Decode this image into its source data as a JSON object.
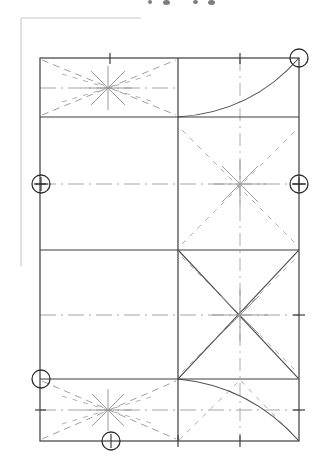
{
  "document": {
    "title": "Technical Fold Pattern Drawing",
    "type": "engineering-line-drawing",
    "canvas": {
      "width": 318,
      "height": 460
    },
    "background_color": "#ffffff",
    "line_color": "#4a4a4a",
    "dashed_color": "#8d8d8d",
    "centerline_color": "#9a9a9a",
    "frame_color": "#c9c9c9"
  },
  "frame": {
    "name": "page-border-fragment",
    "top_rule": {
      "x1": 21,
      "y1": 18,
      "x2": 141,
      "y2": 18
    },
    "left_rule": {
      "x1": 21,
      "y1": 18,
      "x2": 21,
      "y2": 266
    }
  },
  "geometry": {
    "main_rect": {
      "x": 40,
      "y": 58,
      "width": 259,
      "height": 383
    },
    "horizontal_rules_y": [
      58,
      117,
      250,
      379,
      441
    ],
    "vertical_rules_x": [
      40,
      178,
      299
    ],
    "horizontal_centerlines_y": [
      88,
      184,
      315,
      410
    ],
    "vertical_centerlines_x": [
      240
    ],
    "mid_y": 250,
    "divider_x": 178
  },
  "arcs": [
    {
      "name": "upper-right-arc",
      "start": {
        "x": 178,
        "y": 117
      },
      "end": {
        "x": 299,
        "y": 58
      },
      "control": {
        "x": 252,
        "y": 112
      },
      "description": "quarter arc sweeping from centre-left junction to top-right corner"
    },
    {
      "name": "lower-right-arc",
      "start": {
        "x": 178,
        "y": 379
      },
      "end": {
        "x": 299,
        "y": 441
      },
      "control": {
        "x": 250,
        "y": 386
      },
      "description": "quarter arc sweeping from lower junction down to bottom-right corner"
    }
  ],
  "markers": [
    {
      "name": "marker-top-right",
      "cx": 299,
      "cy": 58,
      "r": 9,
      "glyph": "plain-circle"
    },
    {
      "name": "marker-left-middle",
      "cx": 41,
      "cy": 184,
      "r": 9,
      "glyph": "crossed-circle"
    },
    {
      "name": "marker-right-middle",
      "cx": 299,
      "cy": 184,
      "r": 9,
      "glyph": "crossed-circle"
    },
    {
      "name": "marker-bottom-left",
      "cx": 41,
      "cy": 379,
      "r": 9,
      "glyph": "plain-circle"
    },
    {
      "name": "marker-bottom-center",
      "cx": 111,
      "cy": 441,
      "r": 9,
      "glyph": "stem-circle"
    }
  ],
  "ticks": [
    {
      "name": "tick-top-a",
      "x": 110,
      "y": 58,
      "orient": "vertical",
      "len": 11
    },
    {
      "name": "tick-top-b",
      "x": 240,
      "y": 58,
      "orient": "vertical",
      "len": 11
    },
    {
      "name": "tick-left-upper",
      "x": 40,
      "y": 184,
      "orient": "horizontal",
      "len": 11
    },
    {
      "name": "tick-right-upper",
      "x": 299,
      "y": 184,
      "orient": "horizontal",
      "len": 11
    },
    {
      "name": "tick-left-lower",
      "x": 40,
      "y": 410,
      "orient": "horizontal",
      "len": 11
    },
    {
      "name": "tick-right-lower",
      "x": 299,
      "y": 410,
      "orient": "horizontal",
      "len": 11
    },
    {
      "name": "tick-right-mid",
      "x": 299,
      "y": 315,
      "orient": "horizontal",
      "len": 11
    },
    {
      "name": "tick-bottom-a",
      "x": 178,
      "y": 441,
      "orient": "vertical",
      "len": 11
    },
    {
      "name": "tick-bottom-b",
      "x": 240,
      "y": 441,
      "orient": "vertical",
      "len": 11
    }
  ],
  "star_nodes": [
    {
      "name": "star-top-left-band",
      "cx": 108,
      "cy": 88,
      "rays": 8,
      "radius": 24
    },
    {
      "name": "star-right-upper",
      "cx": 240,
      "cy": 184,
      "rays": 8,
      "radius": 26
    },
    {
      "name": "star-right-lower",
      "cx": 240,
      "cy": 315,
      "rays": 8,
      "radius": 28
    },
    {
      "name": "star-bottom-left-band",
      "cx": 108,
      "cy": 410,
      "rays": 8,
      "radius": 24
    }
  ],
  "fold_diagonals": [
    {
      "name": "fold-tl-band-ul",
      "x1": 40,
      "y1": 58,
      "x2": 178,
      "y2": 117
    },
    {
      "name": "fold-tl-band-ll",
      "x1": 40,
      "y1": 117,
      "x2": 178,
      "y2": 58
    },
    {
      "name": "fold-tr-upper",
      "x1": 178,
      "y1": 117,
      "x2": 299,
      "y2": 58
    },
    {
      "name": "fold-br-diag-a",
      "x1": 178,
      "y1": 250,
      "x2": 299,
      "y2": 379
    },
    {
      "name": "fold-br-diag-b",
      "x1": 178,
      "y1": 379,
      "x2": 299,
      "y2": 250
    },
    {
      "name": "fold-bl-band-ul",
      "x1": 40,
      "y1": 379,
      "x2": 178,
      "y2": 441
    },
    {
      "name": "fold-bl-band-ll",
      "x1": 40,
      "y1": 441,
      "x2": 178,
      "y2": 379
    }
  ],
  "top_artifacts": [
    {
      "name": "cropped-glyph-a",
      "x": 148,
      "y": 0,
      "w": 4,
      "h": 4
    },
    {
      "name": "cropped-glyph-b",
      "x": 163,
      "y": 0,
      "w": 7,
      "h": 5
    },
    {
      "name": "cropped-glyph-c",
      "x": 193,
      "y": 0,
      "w": 5,
      "h": 4
    },
    {
      "name": "cropped-glyph-d",
      "x": 208,
      "y": 0,
      "w": 7,
      "h": 5
    }
  ]
}
